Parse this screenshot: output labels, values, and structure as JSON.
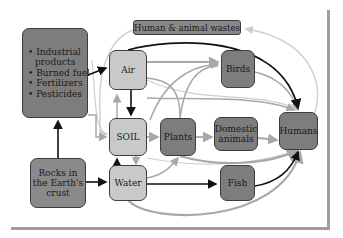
{
  "diagram": {
    "nodes": {
      "sources": {
        "items": [
          "• Industrial",
          "  products",
          "• Burned fuel",
          "• Fertilizers",
          "• Pesticides"
        ]
      },
      "wastes": "Human & animal wastes",
      "air": "Air",
      "birds": "Birds",
      "soil": "SOIL",
      "plants": "Plants",
      "domestic_animals": [
        "Domestic",
        "animals"
      ],
      "humans": "Humans",
      "rocks": [
        "Rocks in",
        "the Earth's",
        "crust"
      ],
      "water": "Water",
      "fish": "Fish"
    },
    "colors": {
      "light_node": "#c9c9c9",
      "dark_node": "#7d7d7d",
      "arrow_dark": "#111111",
      "arrow_mid": "#a8a8a8",
      "arrow_light": "#cfcfcf",
      "frame": "#9d9d9d"
    },
    "edges": [
      {
        "from": "sources",
        "to": "air",
        "style": "dark"
      },
      {
        "from": "rocks",
        "to": "sources",
        "style": "dark"
      },
      {
        "from": "rocks",
        "to": "water",
        "style": "dark"
      },
      {
        "from": "air",
        "to": "soil",
        "style": "dark"
      },
      {
        "from": "soil",
        "to": "air",
        "style": "mid"
      },
      {
        "from": "water",
        "to": "soil",
        "style": "dark"
      },
      {
        "from": "soil",
        "to": "water",
        "style": "mid"
      },
      {
        "from": "air",
        "to": "humans",
        "style": "dark"
      },
      {
        "from": "water",
        "to": "fish",
        "style": "dark"
      },
      {
        "from": "fish",
        "to": "humans",
        "style": "dark"
      },
      {
        "from": "air",
        "to": "birds",
        "style": "mid"
      },
      {
        "from": "soil",
        "to": "plants",
        "style": "mid"
      },
      {
        "from": "plants",
        "to": "domestic_animals",
        "style": "mid"
      },
      {
        "from": "domestic_animals",
        "to": "humans",
        "style": "mid"
      },
      {
        "from": "birds",
        "to": "humans",
        "style": "mid"
      },
      {
        "from": "plants",
        "to": "birds",
        "style": "mid"
      },
      {
        "from": "water",
        "to": "plants",
        "style": "mid"
      },
      {
        "from": "plants",
        "to": "humans",
        "style": "mid"
      },
      {
        "from": "water",
        "to": "humans",
        "style": "mid"
      },
      {
        "from": "humans",
        "to": "wastes",
        "style": "light"
      },
      {
        "from": "wastes",
        "to": "soil",
        "style": "light"
      },
      {
        "from": "sources",
        "to": "soil",
        "style": "mid"
      },
      {
        "from": "air",
        "to": "plants",
        "style": "mid"
      }
    ]
  }
}
